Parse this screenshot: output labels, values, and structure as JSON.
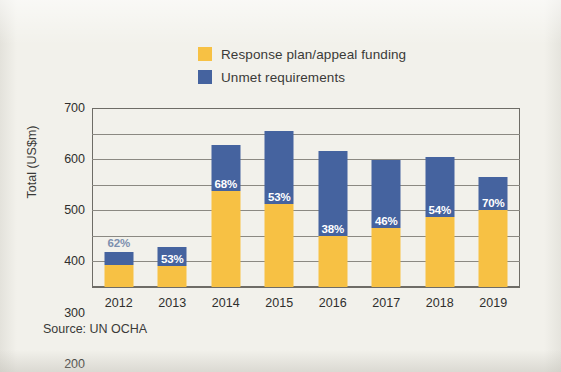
{
  "chart_data": {
    "type": "bar",
    "subtype": "stacked",
    "title": "",
    "xlabel": "",
    "ylabel": "Total (US$m)",
    "ylim": [
      0,
      700
    ],
    "yticks": [
      0,
      100,
      200,
      300,
      400,
      500,
      600,
      700
    ],
    "grid": true,
    "legend_position": "top-center",
    "categories": [
      "2012",
      "2013",
      "2014",
      "2015",
      "2016",
      "2017",
      "2018",
      "2019"
    ],
    "series": [
      {
        "name": "Response plan/appeal funding",
        "color": "#f7c144",
        "values": [
          85,
          82,
          377,
          325,
          201,
          229,
          275,
          301
        ]
      },
      {
        "name": "Unmet requirements",
        "color": "#45639f",
        "values": [
          52,
          73,
          178,
          287,
          329,
          269,
          235,
          129
        ]
      }
    ],
    "totals": [
      137,
      155,
      555,
      612,
      530,
      498,
      510,
      430
    ],
    "annotations": [
      {
        "category": "2012",
        "text": "62%",
        "placement": "above-bar",
        "color": "#7d8fae"
      },
      {
        "category": "2013",
        "text": "53%",
        "placement": "in-unmet",
        "color": "#ffffff"
      },
      {
        "category": "2014",
        "text": "68%",
        "placement": "in-unmet",
        "color": "#ffffff"
      },
      {
        "category": "2015",
        "text": "53%",
        "placement": "in-unmet",
        "color": "#ffffff"
      },
      {
        "category": "2016",
        "text": "38%",
        "placement": "in-unmet",
        "color": "#ffffff"
      },
      {
        "category": "2017",
        "text": "46%",
        "placement": "in-unmet",
        "color": "#ffffff"
      },
      {
        "category": "2018",
        "text": "54%",
        "placement": "in-unmet",
        "color": "#ffffff"
      },
      {
        "category": "2019",
        "text": "70%",
        "placement": "in-unmet",
        "color": "#ffffff"
      }
    ]
  },
  "legend": {
    "items": [
      {
        "label": "Response plan/appeal funding",
        "color": "#f7c144"
      },
      {
        "label": "Unmet requirements",
        "color": "#45639f"
      }
    ]
  },
  "axes": {
    "y_title": "Total (US$m)",
    "y_ticks": [
      "700",
      "600",
      "500",
      "400",
      "300",
      "200",
      "100",
      "0"
    ],
    "x_ticks": [
      "2012",
      "2013",
      "2014",
      "2015",
      "2016",
      "2017",
      "2018",
      "2019"
    ]
  },
  "source": {
    "text": "Source: UN OCHA"
  },
  "colors": {
    "background": "#f2f1eb",
    "funded": "#f7c144",
    "unmet": "#45639f",
    "axis": "#6e6c66",
    "gridline": "#8b8982",
    "text": "#2f2f2d"
  }
}
